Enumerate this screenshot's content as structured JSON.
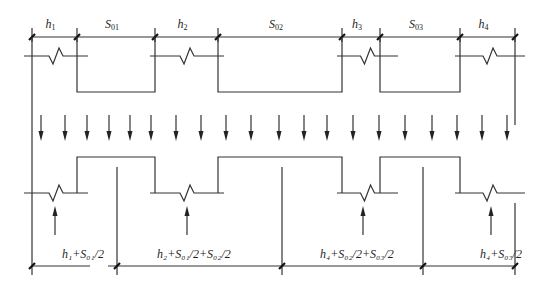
{
  "diagram": {
    "top_dimensions": [
      {
        "base": "h",
        "sub": "1"
      },
      {
        "base": "S",
        "sub": "01"
      },
      {
        "base": "h",
        "sub": "2"
      },
      {
        "base": "S",
        "sub": "02"
      },
      {
        "base": "h",
        "sub": "3"
      },
      {
        "base": "S",
        "sub": "03"
      },
      {
        "base": "h",
        "sub": "4"
      }
    ],
    "bottom_dimensions": [
      "h₁+S₀₁/2",
      "h₂+S₀₁/2+S₀₂/2",
      "h₄+S₀₂/2+S₀₃/2",
      "h₄+S₀₃/2"
    ],
    "load_arrows_down_count": 20,
    "reaction_arrows_up_count": 4
  }
}
